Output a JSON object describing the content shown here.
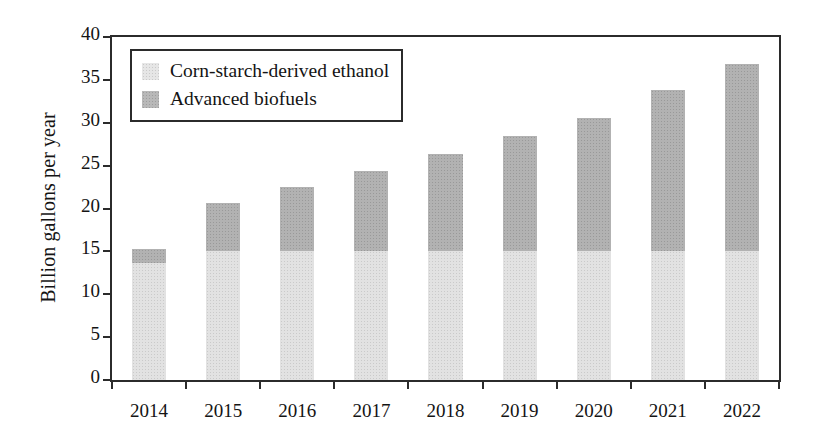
{
  "chart_data": {
    "type": "bar",
    "subtype": "stacked-vertical-bar",
    "title": "",
    "xlabel": "",
    "ylabel": "Billion gallons per year",
    "categories": [
      "2014",
      "2015",
      "2016",
      "2017",
      "2018",
      "2019",
      "2020",
      "2021",
      "2022"
    ],
    "series": [
      {
        "name": "Corn-starch-derived ethanol",
        "color": "#e2e2e2",
        "values": [
          13.6,
          15.0,
          15.0,
          15.0,
          15.0,
          15.0,
          15.0,
          15.0,
          15.0
        ]
      },
      {
        "name": "Advanced biofuels",
        "color": "#b2b2b2",
        "values": [
          1.7,
          5.6,
          7.5,
          9.4,
          11.4,
          13.5,
          15.6,
          18.8,
          21.8
        ]
      }
    ],
    "totals": [
      15.3,
      20.6,
      22.5,
      24.4,
      26.4,
      28.5,
      30.6,
      33.8,
      36.8
    ],
    "ylim": [
      0,
      40
    ],
    "ytick_values": [
      0,
      5,
      10,
      15,
      20,
      25,
      30,
      35,
      40
    ],
    "ytick_labels": [
      "0",
      "5",
      "10",
      "15",
      "20",
      "25",
      "30",
      "35",
      "40"
    ],
    "grid": false,
    "legend_position": "upper left",
    "legend_entries": [
      "Corn-starch-derived ethanol",
      "Advanced biofuels"
    ],
    "annotations": []
  },
  "legend": {
    "items": [
      {
        "label": "Corn-starch-derived ethanol",
        "swatch_name": "legend-swatch-corn-starch"
      },
      {
        "label": "Advanced biofuels",
        "swatch_name": "legend-swatch-advanced"
      }
    ]
  },
  "axes": {
    "y_title": "Billion gallons per year"
  },
  "colors": {
    "corn_starch": "#e2e2e2",
    "advanced_biofuels": "#b2b2b2",
    "axis": "#2b2b2b",
    "text": "#141414",
    "background": "#ffffff"
  }
}
